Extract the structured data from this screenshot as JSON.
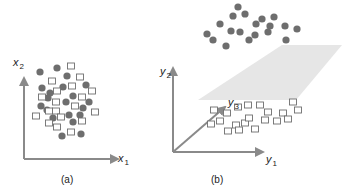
{
  "colors": {
    "axis": "#8a8a8a",
    "dot_fill": "#6e6e6e",
    "square_stroke": "#6e6e6e",
    "plane_fill": "#e6e6e6",
    "text": "#222222"
  },
  "panel_a": {
    "caption": "(a)",
    "x_axis": {
      "var": "x",
      "sub": "1"
    },
    "y_axis": {
      "var": "x",
      "sub": "2"
    },
    "origin": [
      24,
      159
    ],
    "x_end": [
      118,
      159
    ],
    "y_end": [
      24,
      78
    ],
    "dots": [
      [
        40,
        72
      ],
      [
        57,
        68
      ],
      [
        67,
        76
      ],
      [
        42,
        88
      ],
      [
        50,
        93
      ],
      [
        63,
        87
      ],
      [
        86,
        85
      ],
      [
        73,
        96
      ],
      [
        41,
        106
      ],
      [
        47,
        110
      ],
      [
        66,
        102
      ],
      [
        83,
        108
      ],
      [
        89,
        102
      ],
      [
        53,
        118
      ],
      [
        69,
        115
      ],
      [
        80,
        115
      ],
      [
        73,
        122
      ],
      [
        81,
        134
      ],
      [
        62,
        136
      ],
      [
        48,
        98
      ]
    ],
    "squares": [
      [
        71,
        66
      ],
      [
        80,
        77
      ],
      [
        52,
        81
      ],
      [
        72,
        86
      ],
      [
        92,
        91
      ],
      [
        57,
        91
      ],
      [
        42,
        97
      ],
      [
        82,
        97
      ],
      [
        56,
        102
      ],
      [
        75,
        106
      ],
      [
        49,
        111
      ],
      [
        56,
        111
      ],
      [
        95,
        112
      ],
      [
        36,
        116
      ],
      [
        61,
        117
      ],
      [
        49,
        123
      ],
      [
        57,
        127
      ],
      [
        82,
        121
      ],
      [
        71,
        132
      ]
    ]
  },
  "panel_b": {
    "caption": "(b)",
    "y1_axis": {
      "var": "y",
      "sub": "1"
    },
    "y2_axis": {
      "var": "y",
      "sub": "2"
    },
    "y3_axis": {
      "var": "y",
      "sub": "3"
    },
    "origin": [
      173,
      152
    ],
    "y1_end": [
      263,
      152
    ],
    "y2_end": [
      173,
      68
    ],
    "y3_end": [
      225,
      107
    ],
    "plane": [
      [
        282,
        45
      ],
      [
        342,
        45
      ],
      [
        296,
        100
      ],
      [
        198,
        100
      ]
    ],
    "dots": [
      [
        238,
        7
      ],
      [
        233,
        16
      ],
      [
        245,
        14
      ],
      [
        220,
        24
      ],
      [
        256,
        24
      ],
      [
        262,
        19
      ],
      [
        274,
        17
      ],
      [
        285,
        26
      ],
      [
        207,
        34
      ],
      [
        231,
        31
      ],
      [
        240,
        32
      ],
      [
        255,
        35
      ],
      [
        268,
        32
      ],
      [
        270,
        26
      ],
      [
        297,
        29
      ],
      [
        213,
        40
      ],
      [
        226,
        46
      ],
      [
        249,
        40
      ],
      [
        286,
        40
      ]
    ],
    "squares": [
      [
        214,
        110
      ],
      [
        248,
        105
      ],
      [
        260,
        105
      ],
      [
        268,
        112
      ],
      [
        283,
        113
      ],
      [
        298,
        110
      ],
      [
        293,
        102
      ],
      [
        238,
        107
      ],
      [
        227,
        113
      ],
      [
        220,
        121
      ],
      [
        211,
        124
      ],
      [
        236,
        125
      ],
      [
        245,
        123
      ],
      [
        249,
        118
      ],
      [
        265,
        120
      ],
      [
        277,
        121
      ],
      [
        288,
        119
      ],
      [
        228,
        131
      ],
      [
        239,
        130
      ],
      [
        255,
        129
      ]
    ]
  }
}
